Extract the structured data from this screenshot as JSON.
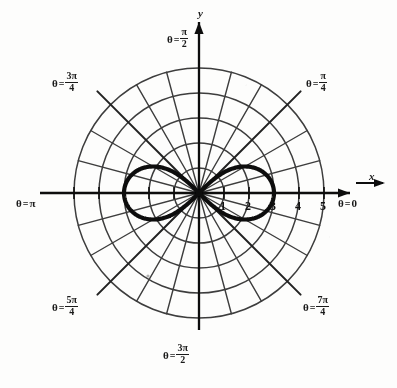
{
  "figure": {
    "axis_x_name": "x",
    "axis_y_name": "y",
    "theta_symbol": "θ",
    "equals": "=",
    "pi": "π"
  },
  "angle_labels": [
    {
      "id": "theta-0",
      "theta_deg": 0,
      "text": "θ = 0",
      "kind": "plain",
      "value": "0"
    },
    {
      "id": "theta-pi-4",
      "theta_deg": 45,
      "text": "θ = π/4",
      "kind": "frac",
      "num": "π",
      "den": "4"
    },
    {
      "id": "theta-pi-2",
      "theta_deg": 90,
      "text": "θ = π/2",
      "kind": "frac",
      "num": "π",
      "den": "2"
    },
    {
      "id": "theta-3pi-4",
      "theta_deg": 135,
      "text": "θ = 3π/4",
      "kind": "frac",
      "num": "3π",
      "den": "4"
    },
    {
      "id": "theta-pi",
      "theta_deg": 180,
      "text": "θ = π",
      "kind": "plain",
      "value": "π"
    },
    {
      "id": "theta-5pi-4",
      "theta_deg": 225,
      "text": "θ = 5π/4",
      "kind": "frac",
      "num": "5π",
      "den": "4"
    },
    {
      "id": "theta-3pi-2",
      "theta_deg": 270,
      "text": "θ = 3π/2",
      "kind": "frac",
      "num": "3π",
      "den": "2"
    },
    {
      "id": "theta-7pi-4",
      "theta_deg": 315,
      "text": "θ = 7π/4",
      "kind": "frac",
      "num": "7π",
      "den": "4"
    }
  ],
  "radial_tick_labels": [
    "1",
    "2",
    "3",
    "4",
    "5"
  ],
  "chart_data": {
    "type": "line",
    "coordinate_system": "polar",
    "title": "",
    "xlabel": "x",
    "ylabel": "y",
    "curve_name": "lemniscate",
    "equation": "r^2 = 9 cos(2θ)",
    "r_max": 3,
    "grid": true,
    "grid_circles_r": [
      1,
      2,
      3,
      4,
      5
    ],
    "grid_spokes_deg": [
      0,
      15,
      30,
      45,
      60,
      75,
      90,
      105,
      120,
      135,
      150,
      165,
      180,
      195,
      210,
      225,
      240,
      255,
      270,
      285,
      300,
      315,
      330,
      345
    ],
    "grid_major_spokes_deg": [
      0,
      45,
      90,
      135,
      180,
      225,
      270,
      315
    ],
    "axis_range_r": [
      0,
      5
    ],
    "radial_ticks": [
      1,
      2,
      3,
      4,
      5
    ],
    "angle_tick_labels_deg": [
      0,
      45,
      90,
      135,
      180,
      225,
      270,
      315
    ],
    "legend_position": "none",
    "series": [
      {
        "name": "r^2 = 9 cos(2θ)",
        "theta_domain_deg": [
          [
            -45,
            45
          ],
          [
            135,
            225
          ]
        ],
        "points_polar": [
          [
            0,
            3.0
          ],
          [
            5,
            2.977
          ],
          [
            10,
            2.908
          ],
          [
            15,
            2.792
          ],
          [
            20,
            2.622
          ],
          [
            25,
            2.39
          ],
          [
            30,
            2.121
          ],
          [
            35,
            1.732
          ],
          [
            40,
            1.249
          ],
          [
            43,
            0.843
          ],
          [
            45,
            0.0
          ],
          [
            135,
            0.0
          ],
          [
            137,
            0.843
          ],
          [
            140,
            1.249
          ],
          [
            145,
            1.732
          ],
          [
            150,
            2.121
          ],
          [
            155,
            2.39
          ],
          [
            160,
            2.622
          ],
          [
            165,
            2.792
          ],
          [
            170,
            2.908
          ],
          [
            175,
            2.977
          ],
          [
            180,
            3.0
          ],
          [
            185,
            2.977
          ],
          [
            190,
            2.908
          ],
          [
            195,
            2.792
          ],
          [
            200,
            2.622
          ],
          [
            205,
            2.39
          ],
          [
            210,
            2.121
          ],
          [
            215,
            1.732
          ],
          [
            220,
            1.249
          ],
          [
            223,
            0.843
          ],
          [
            225,
            0.0
          ],
          [
            315,
            0.0
          ],
          [
            317,
            0.843
          ],
          [
            320,
            1.249
          ],
          [
            325,
            1.732
          ],
          [
            330,
            2.121
          ],
          [
            335,
            2.39
          ],
          [
            340,
            2.622
          ],
          [
            345,
            2.792
          ],
          [
            350,
            2.908
          ],
          [
            355,
            2.977
          ],
          [
            360,
            3.0
          ]
        ]
      }
    ]
  },
  "colors": {
    "curve": "#111111",
    "axis": "#1a1a1a",
    "grid": "#4a4a4a",
    "label": "#1a1a1a",
    "background": "#fdfdfc"
  }
}
